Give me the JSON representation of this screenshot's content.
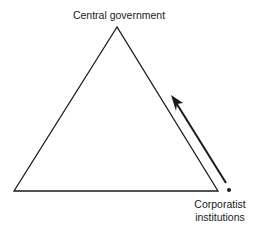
{
  "diagram": {
    "type": "triangle",
    "vertices": {
      "apex": [
        117,
        27
      ],
      "bottom_left": [
        14,
        191
      ],
      "bottom_right": [
        218,
        191
      ]
    },
    "labels": {
      "top": "Central government",
      "bottom_right_line1": "Corporatist",
      "bottom_right_line2": "institutions"
    },
    "arrow": {
      "from": [
        227,
        184
      ],
      "to": [
        171,
        95
      ],
      "direction": "toward central government"
    },
    "marker_dot": [
      229,
      190
    ],
    "colors": {
      "stroke": "#1a1a1a",
      "background": "#ffffff"
    }
  }
}
